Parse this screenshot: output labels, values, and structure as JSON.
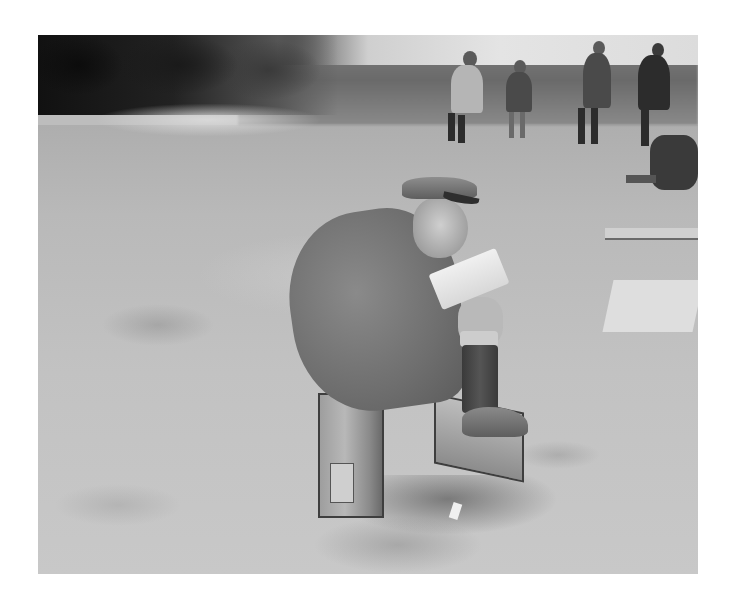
{
  "image": {
    "kind": "black-and-white historical photograph",
    "frame": {
      "x": 38,
      "y": 35,
      "width": 660,
      "height": 539,
      "margin_color": "#ffffff"
    },
    "subject": "Elderly soldier in peaked cap and greatcoat sitting on an ammunition box, writing in a notebook, foot resting on a second box",
    "background": "Dark hedge top-left, grass field, several soldiers standing and one seated at right",
    "tones": {
      "dark": "#1c1c1c",
      "mid": "#7a7a7a",
      "ground": "#bdbdbd",
      "light": "#e0e0e0"
    }
  }
}
